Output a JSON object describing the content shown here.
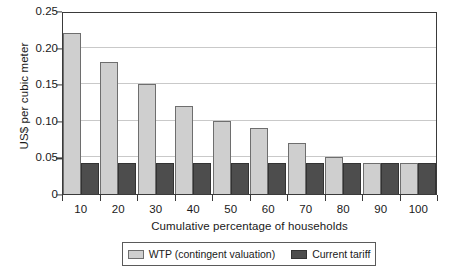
{
  "chart_data": {
    "type": "bar",
    "title": "",
    "xlabel": "Cumulative percentage of households",
    "ylabel": "US$ per cubic meter",
    "categories": [
      "10",
      "20",
      "30",
      "40",
      "50",
      "60",
      "70",
      "80",
      "90",
      "100"
    ],
    "series": [
      {
        "name": "WTP (contingent valuation)",
        "color": "#cfcfcf",
        "values": [
          0.22,
          0.18,
          0.15,
          0.12,
          0.1,
          0.09,
          0.07,
          0.05,
          0.042,
          0.042
        ]
      },
      {
        "name": "Current tariff",
        "color": "#4d4d4d",
        "values": [
          0.042,
          0.042,
          0.042,
          0.042,
          0.042,
          0.042,
          0.042,
          0.042,
          0.042,
          0.042
        ]
      }
    ],
    "ylim": [
      0,
      0.25
    ],
    "yticks": [
      0,
      0.05,
      0.1,
      0.15,
      0.2,
      0.25
    ],
    "ytick_labels": [
      "0",
      "0.05",
      "0.10",
      "0.15",
      "0.20",
      "0.25"
    ],
    "grid": "horizontal",
    "legend_position": "bottom"
  },
  "legend": {
    "entries": [
      {
        "label": "WTP (contingent valuation)"
      },
      {
        "label": "Current tariff"
      }
    ]
  }
}
